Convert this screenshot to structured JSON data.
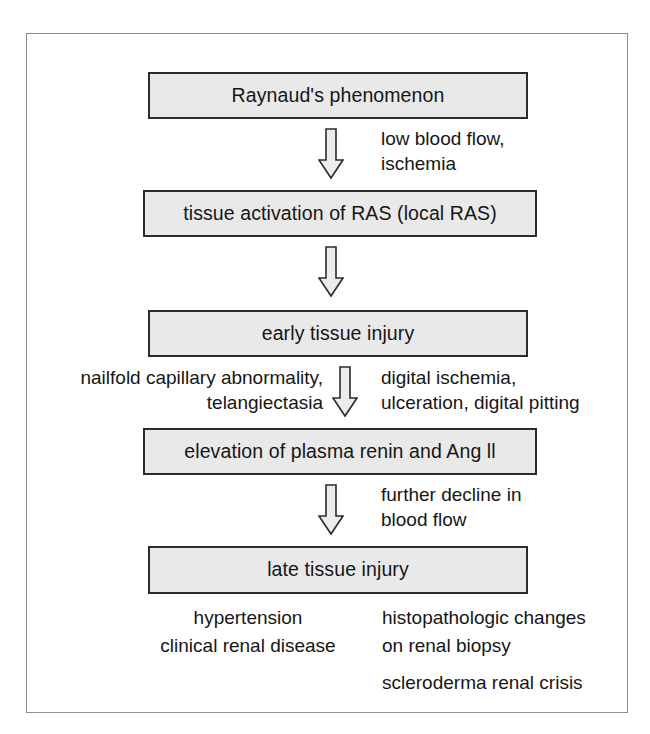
{
  "diagram": {
    "box_fill_color": "#e9e9e9",
    "box_border_color": "#2b2b2b",
    "frame_border_color": "#8c8c8c",
    "nodes": [
      {
        "id": "node-1",
        "label": "Raynaud's phenomenon"
      },
      {
        "id": "node-2",
        "label": "tissue activation of RAS (local RAS)"
      },
      {
        "id": "node-3",
        "label": "early tissue injury"
      },
      {
        "id": "node-4",
        "label": "elevation of plasma renin and Ang ll"
      },
      {
        "id": "node-5",
        "label": "late tissue injury"
      }
    ],
    "arrows": [
      {
        "id": "arrow-1",
        "icon": "down-block-arrow-icon",
        "from": "node-1",
        "to": "node-2"
      },
      {
        "id": "arrow-2",
        "icon": "down-block-arrow-icon",
        "from": "node-2",
        "to": "node-3"
      },
      {
        "id": "arrow-3",
        "icon": "down-block-arrow-icon",
        "from": "node-3",
        "to": "node-4"
      },
      {
        "id": "arrow-4",
        "icon": "down-block-arrow-icon",
        "from": "node-4",
        "to": "node-5"
      }
    ],
    "edge_labels": {
      "flow": {
        "line1": "low blood flow,",
        "line2": "ischemia"
      },
      "nailfold": {
        "line1": "nailfold capillary abnormality,",
        "line2": "telangiectasia"
      },
      "digital": {
        "line1": "digital ischemia,",
        "line2": "ulceration, digital pitting"
      },
      "further": {
        "line1": "further decline in",
        "line2": "blood flow"
      }
    },
    "outcomes": {
      "left_column": [
        "hypertension",
        "clinical renal disease"
      ],
      "right_column": [
        "histopathologic changes",
        "on renal biopsy",
        "scleroderma renal crisis"
      ]
    }
  }
}
